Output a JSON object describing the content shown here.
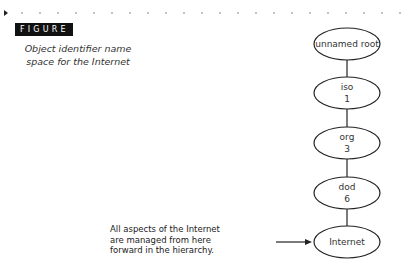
{
  "figure": {
    "label": "FIGURE 13.4",
    "caption_line1": "Object identifier name",
    "caption_line2": "space for the Internet"
  },
  "diagram": {
    "nodes": [
      {
        "name": "unnamed root",
        "number": ""
      },
      {
        "name": "iso",
        "number": "1"
      },
      {
        "name": "org",
        "number": "3"
      },
      {
        "name": "dod",
        "number": "6"
      },
      {
        "name": "Internet",
        "number": ""
      }
    ],
    "annotation": {
      "line1": "All aspects of the Internet",
      "line2": "are managed from here",
      "line3": "forward in the hierarchy.",
      "points_to": "Internet"
    }
  },
  "colors": {
    "badge_bg": "#111111",
    "badge_text": "#ffffff",
    "stroke": "#222222"
  }
}
